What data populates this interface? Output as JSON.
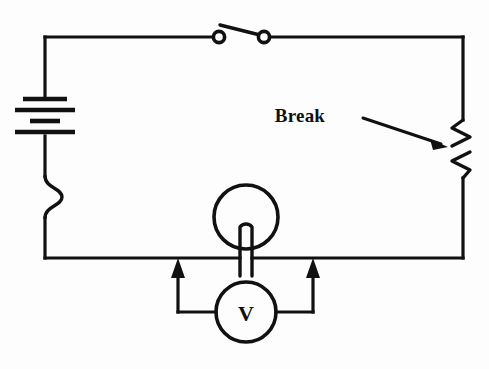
{
  "diagram": {
    "background_color": "#fdfdfd",
    "line_color": "#111111",
    "annotations": [
      {
        "id": "break-label",
        "text": "Break",
        "x": 300,
        "y": 122,
        "points_to": "resistor-break-gap"
      }
    ],
    "components": [
      {
        "id": "battery",
        "name": "battery",
        "position": "left-branch-upper",
        "plates": 4,
        "label": ""
      },
      {
        "id": "switch",
        "name": "open-switch",
        "position": "top-branch-center",
        "state": "open",
        "label": ""
      },
      {
        "id": "resistor-broken",
        "name": "broken-resistor",
        "position": "right-branch",
        "state": "broken",
        "label": "Break"
      },
      {
        "id": "resistor-left",
        "name": "curved-wire-kink",
        "position": "left-branch-lower",
        "label": ""
      },
      {
        "id": "lamp",
        "name": "lamp",
        "position": "bottom-branch-center",
        "label": ""
      },
      {
        "id": "voltmeter",
        "name": "voltmeter",
        "position": "below-bottom-branch",
        "label": "V"
      }
    ],
    "meter": {
      "symbol": "V",
      "type": "voltmeter",
      "probe_count": 2,
      "probe_direction": "up"
    },
    "geometry": {
      "left_x": 45,
      "right_x": 463,
      "top_y": 37,
      "bottom_y": 258
    }
  }
}
